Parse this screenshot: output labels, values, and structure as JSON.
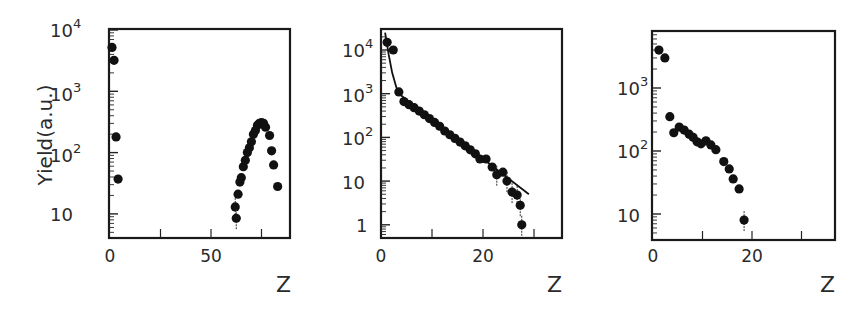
{
  "chart_data": [
    {
      "type": "scatter",
      "title": "",
      "xlabel": "Z",
      "ylabel": "Yield(a.u.)",
      "yscale": "log",
      "xlim": [
        0,
        89
      ],
      "ylim": [
        4,
        10000
      ],
      "xticks": [
        0,
        50
      ],
      "xminor": [
        25,
        75
      ],
      "yticks": [
        "10^4",
        "10^3",
        "10^2",
        "10"
      ],
      "ytick_values": [
        10000,
        1000,
        100,
        10
      ],
      "grid": false,
      "series": [
        {
          "name": "data",
          "marker": "filled-circle",
          "x": [
            1,
            2,
            3,
            4,
            62,
            62.5,
            63.4,
            64.3,
            65,
            66,
            67,
            68,
            69,
            70,
            71,
            72,
            73,
            74,
            75,
            76,
            77,
            79,
            80,
            81,
            83
          ],
          "y": [
            5200,
            3200,
            180,
            37,
            13,
            8.5,
            21,
            33,
            39,
            59,
            75,
            100,
            120,
            150,
            200,
            230,
            280,
            300,
            310,
            300,
            260,
            190,
            107,
            63,
            28
          ]
        }
      ]
    },
    {
      "type": "scatter",
      "title": "",
      "xlabel": "Z",
      "ylabel": "",
      "yscale": "log",
      "xlim": [
        0,
        35.5
      ],
      "ylim": [
        0.5,
        30000
      ],
      "xticks": [
        0,
        20
      ],
      "xminor": [
        10,
        30
      ],
      "yticks": [
        "10^4",
        "10^3",
        "10^2",
        "10",
        "1"
      ],
      "ytick_values": [
        10000,
        1000,
        100,
        10,
        1
      ],
      "grid": false,
      "series": [
        {
          "name": "data",
          "marker": "filled-circle",
          "x": [
            1.2,
            2.4,
            3.5,
            4.5,
            5.5,
            6.5,
            7.5,
            8.5,
            9.5,
            10.5,
            11.5,
            12.5,
            13.5,
            14.5,
            15.5,
            16.5,
            17.5,
            18.5,
            19.4,
            20.6,
            21.8,
            22.7,
            23.9,
            24.7,
            25.7,
            26.7,
            27.3,
            27.6
          ],
          "y": [
            15000,
            10000,
            1100,
            660,
            560,
            480,
            400,
            330,
            270,
            220,
            180,
            140,
            115,
            95,
            78,
            64,
            52,
            42,
            32,
            32,
            21,
            14,
            16,
            10,
            5.6,
            4.8,
            2.8,
            1
          ]
        },
        {
          "name": "fit",
          "type": "line",
          "x": [
            0.8,
            1.5,
            2.2,
            3.0,
            3.5,
            29
          ],
          "y": [
            25000,
            8000,
            3000,
            1400,
            1000,
            5
          ]
        }
      ]
    },
    {
      "type": "scatter",
      "title": "",
      "xlabel": "Z",
      "ylabel": "",
      "yscale": "log",
      "xlim": [
        0,
        37
      ],
      "ylim": [
        4,
        8000
      ],
      "xticks": [
        0,
        20
      ],
      "xminor": [
        10,
        30
      ],
      "yticks": [
        "10^3",
        "10^2",
        "10"
      ],
      "ytick_values": [
        1000,
        100,
        10
      ],
      "grid": false,
      "series": [
        {
          "name": "data",
          "marker": "filled-circle",
          "x": [
            1.2,
            2.4,
            3.4,
            4.2,
            5.3,
            6.3,
            7.3,
            8.1,
            8.9,
            9.7,
            10.7,
            11.7,
            12.7,
            14.3,
            15.4,
            16.2,
            17.4,
            18.4
          ],
          "y": [
            4000,
            3000,
            350,
            195,
            240,
            215,
            185,
            165,
            140,
            130,
            145,
            125,
            105,
            68,
            52,
            36,
            25,
            8
          ]
        }
      ]
    }
  ],
  "panels": [
    {
      "ylabel": "Yield(a.u.)",
      "xlabel": "Z",
      "xtick_labels": [
        "0",
        "50"
      ],
      "ytick_labels": [
        {
          "base": "10",
          "exp": "4"
        },
        {
          "base": "10",
          "exp": "3"
        },
        {
          "base": "10",
          "exp": "2"
        },
        {
          "base": "10",
          "exp": ""
        }
      ]
    },
    {
      "ylabel": "",
      "xlabel": "Z",
      "xtick_labels": [
        "0",
        "20"
      ],
      "ytick_labels": [
        {
          "base": "10",
          "exp": "4"
        },
        {
          "base": "10",
          "exp": "3"
        },
        {
          "base": "10",
          "exp": "2"
        },
        {
          "base": "10",
          "exp": ""
        },
        {
          "base": "1",
          "exp": ""
        }
      ]
    },
    {
      "ylabel": "",
      "xlabel": "Z",
      "xtick_labels": [
        "0",
        "20"
      ],
      "ytick_labels": [
        {
          "base": "10",
          "exp": "3"
        },
        {
          "base": "10",
          "exp": "2"
        },
        {
          "base": "10",
          "exp": ""
        }
      ]
    }
  ]
}
